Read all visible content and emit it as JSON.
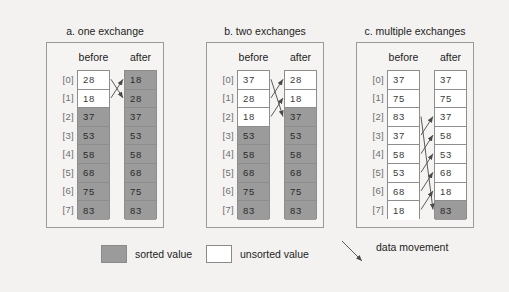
{
  "figure": {
    "background_color": "#f3f2f0",
    "sorted_color": "#9b9b9b",
    "unsorted_color": "#ffffff",
    "index_labels": [
      "[0]",
      "[1]",
      "[2]",
      "[3]",
      "[4]",
      "[5]",
      "[6]",
      "[7]"
    ],
    "column_headers": {
      "before": "before",
      "after": "after"
    }
  },
  "panels": [
    {
      "title": "a. one exchange",
      "before": {
        "values": [
          "28",
          "18",
          "37",
          "53",
          "58",
          "68",
          "75",
          "83"
        ],
        "states": [
          "unsorted",
          "unsorted",
          "sorted",
          "sorted",
          "sorted",
          "sorted",
          "sorted",
          "sorted"
        ]
      },
      "after": {
        "values": [
          "18",
          "28",
          "37",
          "53",
          "58",
          "68",
          "75",
          "83"
        ],
        "states": [
          "sorted",
          "sorted",
          "sorted",
          "sorted",
          "sorted",
          "sorted",
          "sorted",
          "sorted"
        ]
      },
      "movements": [
        {
          "from": 0,
          "to": 1
        },
        {
          "from": 1,
          "to": 0
        }
      ]
    },
    {
      "title": "b. two exchanges",
      "before": {
        "values": [
          "37",
          "28",
          "18",
          "53",
          "58",
          "68",
          "75",
          "83"
        ],
        "states": [
          "unsorted",
          "unsorted",
          "unsorted",
          "sorted",
          "sorted",
          "sorted",
          "sorted",
          "sorted"
        ]
      },
      "after": {
        "values": [
          "28",
          "18",
          "37",
          "53",
          "58",
          "68",
          "75",
          "83"
        ],
        "states": [
          "unsorted",
          "unsorted",
          "sorted",
          "sorted",
          "sorted",
          "sorted",
          "sorted",
          "sorted"
        ]
      },
      "movements": [
        {
          "from": 0,
          "to": 2
        },
        {
          "from": 1,
          "to": 0
        },
        {
          "from": 2,
          "to": 1
        }
      ]
    },
    {
      "title": "c. multiple exchanges",
      "before": {
        "values": [
          "37",
          "75",
          "83",
          "37",
          "58",
          "53",
          "68",
          "18"
        ],
        "states": [
          "unsorted",
          "unsorted",
          "unsorted",
          "unsorted",
          "unsorted",
          "unsorted",
          "unsorted",
          "unsorted"
        ]
      },
      "after": {
        "values": [
          "37",
          "75",
          "37",
          "58",
          "53",
          "68",
          "18",
          "83"
        ],
        "states": [
          "unsorted",
          "unsorted",
          "unsorted",
          "unsorted",
          "unsorted",
          "unsorted",
          "unsorted",
          "sorted"
        ]
      },
      "movements": [
        {
          "from": 2,
          "to": 7
        },
        {
          "from": 3,
          "to": 2
        },
        {
          "from": 4,
          "to": 3
        },
        {
          "from": 5,
          "to": 4
        },
        {
          "from": 6,
          "to": 5
        },
        {
          "from": 7,
          "to": 6
        }
      ]
    }
  ],
  "legend": {
    "sorted_label": "sorted value",
    "unsorted_label": "unsorted value",
    "movement_label": "data movement"
  }
}
